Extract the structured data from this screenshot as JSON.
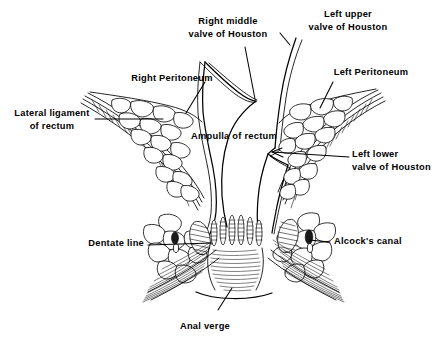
{
  "figure": {
    "background_color": "#ffffff",
    "ink_color": "#000000",
    "width": 434,
    "height": 346
  },
  "labels": {
    "right_middle_valve": {
      "line1": "Right middle",
      "line2": "valve of Houston"
    },
    "left_upper_valve": {
      "line1": "Left upper",
      "line2": "valve of Houston"
    },
    "right_peritoneum": {
      "line1": "Right Peritoneum"
    },
    "left_peritoneum": {
      "line1": "Left Peritoneum"
    },
    "lateral_ligament": {
      "line1": "Lateral ligament",
      "line2": "of rectum"
    },
    "ampulla": {
      "line1": "Ampulla of rectum"
    },
    "left_lower_valve": {
      "line1": "Left lower",
      "line2": "valve of Houston"
    },
    "dentate_line": {
      "line1": "Dentate line"
    },
    "alcocks_canal": {
      "line1": "Alcock's canal"
    },
    "anal_verge": {
      "line1": "Anal verge"
    }
  },
  "structures": {
    "rectal_wall": "rectal-wall-outline",
    "ampulla_lumen": "ampulla-of-rectum-lumen",
    "right_ischiorectal_fossa": "right-ischiorectal-fat",
    "left_ischiorectal_fossa": "left-ischiorectal-fat",
    "anal_columns": "columns-of-morgagni",
    "sphincter_fibers": "external-sphincter-fibers",
    "levator_fibers": "levator-ani-fibers",
    "pudendal_vessels": "alcocks-canal-vessels"
  }
}
